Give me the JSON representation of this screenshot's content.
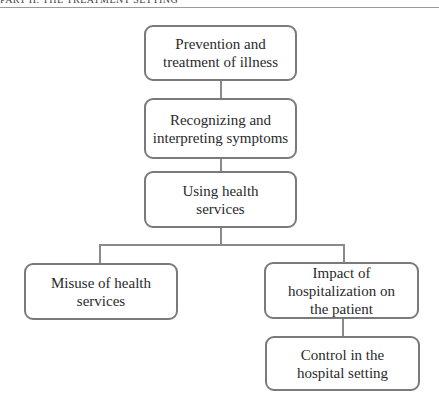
{
  "header": {
    "running_head": "PART II: THE TREATMENT SETTING"
  },
  "diagram": {
    "nodes": [
      {
        "id": "n1",
        "label": "Prevention and treatment of illness"
      },
      {
        "id": "n2",
        "label": "Recognizing and interpreting symptoms"
      },
      {
        "id": "n3",
        "label": "Using health services"
      },
      {
        "id": "n4",
        "label": "Misuse of health services"
      },
      {
        "id": "n5",
        "label": "Impact of hospitalization on the patient"
      },
      {
        "id": "n6",
        "label": "Control in the hospital setting"
      }
    ],
    "edges": [
      {
        "from": "n1",
        "to": "n2"
      },
      {
        "from": "n2",
        "to": "n3"
      },
      {
        "from": "n3",
        "to": "n4"
      },
      {
        "from": "n3",
        "to": "n5"
      },
      {
        "from": "n5",
        "to": "n6"
      }
    ],
    "colors": {
      "border": "#7a7a7a",
      "text": "#2a2a2a",
      "background": "#ffffff"
    }
  }
}
